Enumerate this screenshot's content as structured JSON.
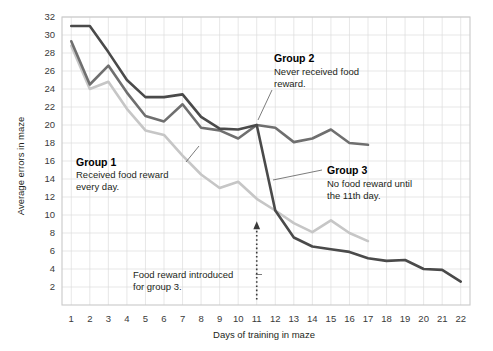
{
  "chart_data": {
    "type": "line",
    "title": "",
    "xlabel": "Days of training in maze",
    "ylabel": "Average errors in maze",
    "x": [
      1,
      2,
      3,
      4,
      5,
      6,
      7,
      8,
      9,
      10,
      11,
      12,
      13,
      14,
      15,
      16,
      17,
      18,
      19,
      20,
      21,
      22
    ],
    "xlim": [
      0.5,
      22.5
    ],
    "ylim": [
      0,
      32
    ],
    "yticks": [
      2,
      4,
      6,
      8,
      10,
      12,
      14,
      16,
      18,
      20,
      22,
      24,
      26,
      28,
      30,
      32
    ],
    "xticks": [
      1,
      2,
      3,
      4,
      5,
      6,
      7,
      8,
      9,
      10,
      11,
      12,
      13,
      14,
      15,
      16,
      17,
      18,
      19,
      20,
      21,
      22
    ],
    "grid": true,
    "legend_position": "inline-annotations",
    "series": [
      {
        "name": "Group 1",
        "color": "#c6c6c6",
        "x": [
          1,
          2,
          3,
          4,
          5,
          6,
          7,
          8,
          9,
          10,
          11,
          12,
          13,
          14,
          15,
          16,
          17
        ],
        "values": [
          28.8,
          24.0,
          24.8,
          21.8,
          19.4,
          18.9,
          16.6,
          14.5,
          13.0,
          13.7,
          11.8,
          10.5,
          9.1,
          8.1,
          9.4,
          8.0,
          7.1
        ]
      },
      {
        "name": "Group 2",
        "color": "#6f6f6f",
        "x": [
          1,
          2,
          3,
          4,
          5,
          6,
          7,
          8,
          9,
          10,
          11,
          12,
          13,
          14,
          15,
          16,
          17
        ],
        "values": [
          29.3,
          24.5,
          26.6,
          23.6,
          21.0,
          20.4,
          22.3,
          19.7,
          19.4,
          18.5,
          20.0,
          19.7,
          18.1,
          18.5,
          19.5,
          18.0,
          17.8
        ]
      },
      {
        "name": "Group 3",
        "color": "#4a4a4a",
        "x": [
          1,
          2,
          3,
          4,
          5,
          6,
          7,
          8,
          9,
          10,
          11,
          12,
          13,
          14,
          15,
          16,
          17,
          18,
          19,
          20,
          21,
          22
        ],
        "values": [
          31.0,
          31.0,
          28.1,
          25.0,
          23.1,
          23.1,
          23.4,
          20.9,
          19.6,
          19.5,
          20.0,
          10.5,
          7.5,
          6.5,
          6.2,
          5.9,
          5.2,
          4.9,
          5.0,
          4.0,
          3.9,
          2.6
        ]
      }
    ],
    "annotations": [
      {
        "id": "group1",
        "title": "Group 1",
        "body_lines": [
          "Received food reward",
          "every day."
        ]
      },
      {
        "id": "group2",
        "title": "Group 2",
        "body_lines": [
          "Never received food",
          "reward."
        ]
      },
      {
        "id": "group3",
        "title": "Group 3",
        "body_lines": [
          "No food reward until",
          "the 11th day."
        ]
      },
      {
        "id": "food-reward",
        "title": "",
        "body_lines": [
          "Food reward introduced",
          "for group 3."
        ],
        "marker_day": 11
      }
    ]
  },
  "axes": {
    "y_tick_labels": [
      "32",
      "30",
      "28",
      "26",
      "24",
      "22",
      "20",
      "18",
      "16",
      "14",
      "12",
      "10",
      "8",
      "6",
      "4",
      "2"
    ],
    "x_tick_labels": [
      "1",
      "2",
      "3",
      "4",
      "5",
      "6",
      "7",
      "8",
      "9",
      "10",
      "11",
      "12",
      "13",
      "14",
      "15",
      "16",
      "17",
      "18",
      "19",
      "20",
      "21",
      "22"
    ],
    "y_title": "Average errors in maze",
    "x_title": "Days of training in maze"
  },
  "annotations_text": {
    "group1_title": "Group 1",
    "group1_line1": "Received food reward",
    "group1_line2": "every day.",
    "group2_title": "Group 2",
    "group2_line1": "Never received food",
    "group2_line2": "reward.",
    "group3_title": "Group 3",
    "group3_line1": "No food reward until",
    "group3_line2": "the 11th day.",
    "food_line1": "Food reward introduced",
    "food_line2": "for group 3."
  },
  "colors": {
    "group1": "#c6c6c6",
    "group2": "#6f6f6f",
    "group3": "#4a4a4a",
    "grid": "#dcdcdc",
    "frame": "#c9c9c9",
    "text": "#231f20"
  }
}
